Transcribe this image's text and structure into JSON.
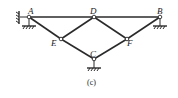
{
  "diagram": {
    "caption": "(c)",
    "nodes": {
      "A": {
        "label": "A",
        "x": 29,
        "y": 17
      },
      "D": {
        "label": "D",
        "x": 94,
        "y": 17
      },
      "B": {
        "label": "B",
        "x": 160,
        "y": 17
      },
      "E": {
        "label": "E",
        "x": 61,
        "y": 39
      },
      "F": {
        "label": "F",
        "x": 127,
        "y": 39
      },
      "C": {
        "label": "C",
        "x": 94,
        "y": 59
      }
    },
    "members": [
      [
        "A",
        "D"
      ],
      [
        "D",
        "B"
      ],
      [
        "A",
        "E"
      ],
      [
        "E",
        "C"
      ],
      [
        "C",
        "F"
      ],
      [
        "F",
        "B"
      ],
      [
        "E",
        "D"
      ],
      [
        "D",
        "F"
      ]
    ],
    "supports": [
      {
        "node": "A",
        "type": "pin-down"
      },
      {
        "node": "A",
        "type": "pin-left"
      },
      {
        "node": "B",
        "type": "pin-down"
      },
      {
        "node": "C",
        "type": "pin-down"
      }
    ],
    "color": "#2a2a2a"
  }
}
